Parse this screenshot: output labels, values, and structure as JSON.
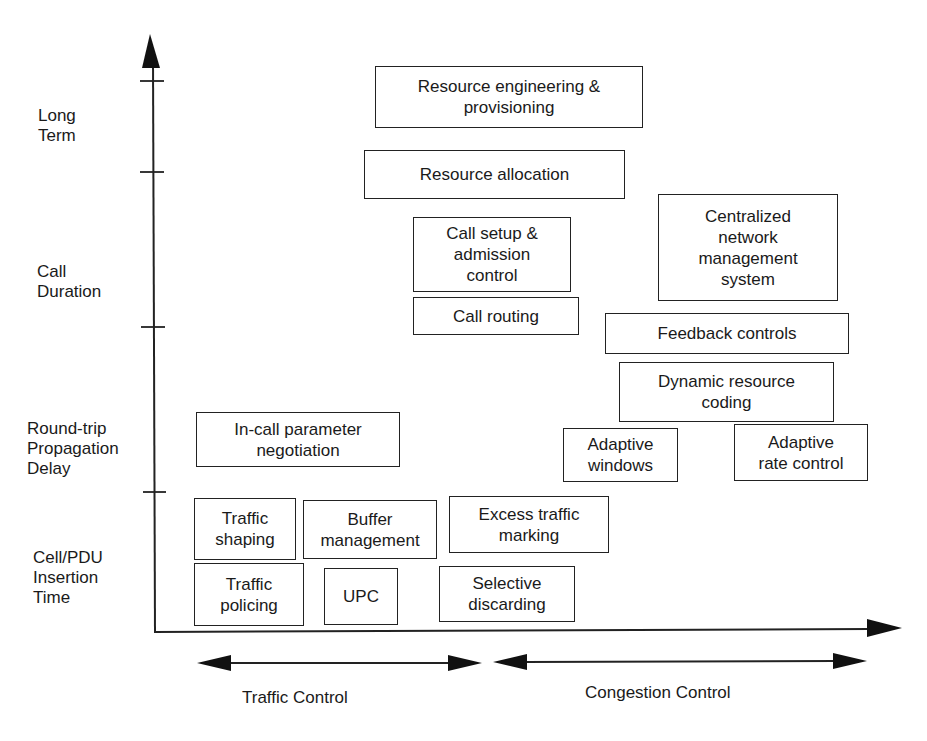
{
  "y_axis": {
    "labels": [
      {
        "id": "long-term",
        "text": "Long\nTerm"
      },
      {
        "id": "call-duration",
        "text": "Call\nDuration"
      },
      {
        "id": "round-trip",
        "text": "Round-trip\nPropagation\nDelay"
      },
      {
        "id": "cell-pdu",
        "text": "Cell/PDU\nInsertion\nTime"
      }
    ]
  },
  "boxes": [
    {
      "id": "resource-engineering",
      "text": "Resource engineering &\nprovisioning"
    },
    {
      "id": "resource-allocation",
      "text": "Resource allocation"
    },
    {
      "id": "call-setup",
      "text": "Call setup &\nadmission\ncontrol"
    },
    {
      "id": "call-routing",
      "text": "Call routing"
    },
    {
      "id": "centralized-nms",
      "text": "Centralized\nnetwork\nmanagement\nsystem"
    },
    {
      "id": "feedback-controls",
      "text": "Feedback controls"
    },
    {
      "id": "dynamic-resource-coding",
      "text": "Dynamic resource\ncoding"
    },
    {
      "id": "in-call-negotiation",
      "text": "In-call parameter\nnegotiation"
    },
    {
      "id": "adaptive-windows",
      "text": "Adaptive\nwindows"
    },
    {
      "id": "adaptive-rate-control",
      "text": "Adaptive\nrate control"
    },
    {
      "id": "traffic-shaping",
      "text": "Traffic\nshaping"
    },
    {
      "id": "buffer-management",
      "text": "Buffer\nmanagement"
    },
    {
      "id": "excess-traffic-marking",
      "text": "Excess traffic\nmarking"
    },
    {
      "id": "traffic-policing",
      "text": "Traffic\npolicing"
    },
    {
      "id": "upc",
      "text": "UPC"
    },
    {
      "id": "selective-discarding",
      "text": "Selective\ndiscarding"
    }
  ],
  "x_axis": {
    "ranges": [
      {
        "id": "traffic-control",
        "text": "Traffic Control"
      },
      {
        "id": "congestion-control",
        "text": "Congestion Control"
      }
    ]
  }
}
